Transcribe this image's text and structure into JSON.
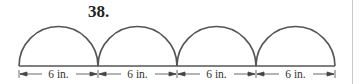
{
  "problem": {
    "number": "38."
  },
  "figure": {
    "semicircle_count": 4,
    "segments": [
      {
        "label": "6 in."
      },
      {
        "label": "6 in."
      },
      {
        "label": "6 in."
      },
      {
        "label": "6 in."
      }
    ],
    "stroke_color": "#555555"
  }
}
